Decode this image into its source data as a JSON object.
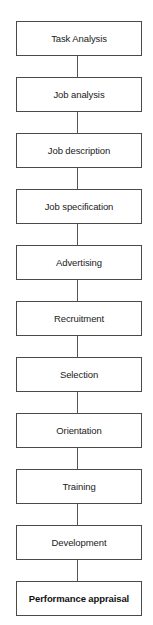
{
  "diagram": {
    "type": "vertical-flowchart",
    "steps": [
      {
        "label": "Task Analysis",
        "bold": false
      },
      {
        "label": "Job analysis",
        "bold": false
      },
      {
        "label": "Job description",
        "bold": false
      },
      {
        "label": "Job specification",
        "bold": false
      },
      {
        "label": "Advertising",
        "bold": false
      },
      {
        "label": "Recruitment",
        "bold": false
      },
      {
        "label": "Selection",
        "bold": false
      },
      {
        "label": "Orientation",
        "bold": false
      },
      {
        "label": "Training",
        "bold": false
      },
      {
        "label": "Development",
        "bold": false
      },
      {
        "label": "Performance appraisal",
        "bold": true
      }
    ],
    "colors": {
      "border": "#4a4a4a",
      "connector": "#555555",
      "text": "#222222",
      "background": "#ffffff"
    }
  }
}
